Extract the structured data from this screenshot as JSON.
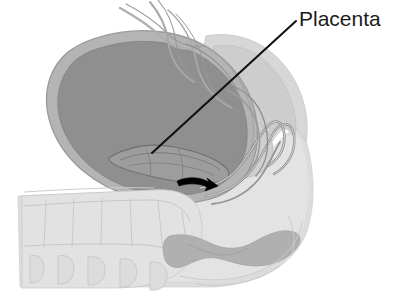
{
  "figure": {
    "name": "placenta-previa-sagittal-illustration",
    "background_color": "#ffffff",
    "width": 401,
    "height": 301
  },
  "labels": [
    {
      "id": "placenta",
      "text": "Placenta",
      "color": "#1b1b1b",
      "font_size_px": 21,
      "position": {
        "x": 299,
        "y": 8
      }
    }
  ],
  "annotations": {
    "leader_line": {
      "name": "placenta-leader-line",
      "color": "#111111",
      "stroke_width": 2.1,
      "from": {
        "x": 152,
        "y": 153
      },
      "to": {
        "x": 296,
        "y": 21
      }
    },
    "direction_arrow": {
      "name": "descent-direction-arrow",
      "color": "#000000",
      "description": "curved black arrow pointing right, indicating direction of descent",
      "start": {
        "x": 177,
        "y": 182
      },
      "tip": {
        "x": 216,
        "y": 187
      }
    }
  },
  "palette": {
    "background": "#ffffff",
    "uterine_cavity": "#8f8f8f",
    "uterine_wall": "#b4b4b4",
    "uterine_wall_outline": "#9a9a9a",
    "placenta_fill": "#9d9d9d",
    "placenta_outline": "#6f6f6f",
    "soft_tissue_light": "#dcdcdc",
    "soft_tissue_mid": "#c6c6c6",
    "soft_tissue_pale": "#e8e8e8",
    "pelvic_muscle": "#b0b0b0",
    "bone_vertebra": "#e2e2e2",
    "bone_outline": "#bdbdbd",
    "membrane_line": "#8d8d8d",
    "canal_line": "#8a8a8a",
    "ink": "#111111"
  },
  "structures": [
    {
      "id": "maternal-torso",
      "label": "maternal torso soft tissue",
      "fill": "#dcdcdc"
    },
    {
      "id": "lumbar-sacral-spine",
      "label": "lumbar and sacral vertebrae",
      "fill": "#e2e2e2"
    },
    {
      "id": "uterus-wall",
      "label": "uterine wall",
      "fill": "#b4b4b4"
    },
    {
      "id": "uterus-cavity",
      "label": "uterine cavity / amniotic space",
      "fill": "#8f8f8f"
    },
    {
      "id": "placenta",
      "label": "placenta overlying internal os",
      "fill": "#9d9d9d"
    },
    {
      "id": "cervix-canal",
      "label": "cervix and birth canal",
      "fill": "#c6c6c6"
    },
    {
      "id": "abdominal-wall",
      "label": "anterior abdominal wall layers",
      "fill": "#d3d3d3"
    },
    {
      "id": "bladder",
      "label": "urinary bladder region",
      "fill": "#cfcfcf"
    },
    {
      "id": "pelvic-floor",
      "label": "pelvic floor musculature",
      "fill": "#b0b0b0"
    },
    {
      "id": "umbilical-cord",
      "label": "umbilical cord and membranes",
      "fill": "#cccccc"
    }
  ]
}
